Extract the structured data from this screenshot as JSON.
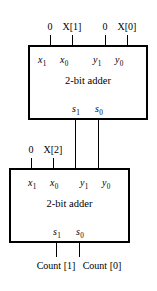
{
  "diagram": {
    "line_color": "#000000",
    "background_color": "#ffffff",
    "blocks": [
      {
        "id": "adder-top",
        "label": "2-bit adder",
        "inputs": [
          {
            "port": "x",
            "sub": "1"
          },
          {
            "port": "x",
            "sub": "0"
          },
          {
            "port": "y",
            "sub": "1"
          },
          {
            "port": "y",
            "sub": "0"
          }
        ],
        "outputs": [
          {
            "port": "s",
            "sub": "1"
          },
          {
            "port": "s",
            "sub": "0"
          }
        ],
        "input_signals": [
          "0",
          "X[1]",
          "0",
          "X[0]"
        ]
      },
      {
        "id": "adder-bottom",
        "label": "2-bit adder",
        "inputs": [
          {
            "port": "x",
            "sub": "1"
          },
          {
            "port": "x",
            "sub": "0"
          },
          {
            "port": "y",
            "sub": "1"
          },
          {
            "port": "y",
            "sub": "0"
          }
        ],
        "outputs": [
          {
            "port": "s",
            "sub": "1"
          },
          {
            "port": "s",
            "sub": "0"
          }
        ],
        "input_signals": [
          "0",
          "X[2]"
        ],
        "output_signals": [
          "Count [1]",
          "Count [0]"
        ]
      }
    ],
    "top_inputs": {
      "in_x1": "0",
      "in_x0": "X[1]",
      "in_y1": "0",
      "in_y0": "X[0]"
    },
    "bottom_inputs": {
      "in_x1": "0",
      "in_x0": "X[2]"
    },
    "bottom_outputs": {
      "out_s1": "Count [1]",
      "out_s0": "Count [0]"
    },
    "ports": {
      "x1": "x",
      "x1_sub": "1",
      "x0": "x",
      "x0_sub": "0",
      "y1": "y",
      "y1_sub": "1",
      "y0": "y",
      "y0_sub": "0",
      "s1": "s",
      "s1_sub": "1",
      "s0": "s",
      "s0_sub": "0"
    },
    "block_label": "2-bit adder"
  }
}
